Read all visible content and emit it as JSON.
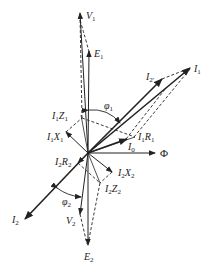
{
  "diagram": {
    "type": "transformer-phasor-diagram",
    "origin": [
      88,
      153
    ],
    "colors": {
      "line": "#222222",
      "background": "#ffffff"
    },
    "phasors": [
      {
        "id": "V1",
        "label": "V",
        "sub": "1",
        "to": [
          80,
          12
        ],
        "style": "solid-thin"
      },
      {
        "id": "E1",
        "label": "E",
        "sub": "1",
        "to": [
          89,
          52
        ],
        "style": "solid-thin"
      },
      {
        "id": "I1",
        "label": "I",
        "sub": "1",
        "to": [
          191,
          67
        ],
        "style": "solid-bold"
      },
      {
        "id": "I2p",
        "label": "I",
        "sub": "2'",
        "to": [
          162,
          78
        ],
        "style": "solid-bold"
      },
      {
        "id": "I0",
        "label": "I",
        "sub": "0",
        "to": [
          126,
          139
        ],
        "style": "solid-bold"
      },
      {
        "id": "Phi",
        "label": "Φ",
        "sub": "",
        "to": [
          155,
          153
        ],
        "style": "solid-thin"
      },
      {
        "id": "I2",
        "label": "I",
        "sub": "2",
        "to": [
          25,
          219
        ],
        "style": "solid-bold"
      },
      {
        "id": "V2",
        "label": "V",
        "sub": "2",
        "to": [
          80,
          214
        ],
        "style": "solid-thin"
      },
      {
        "id": "E2",
        "label": "E",
        "sub": "2",
        "to": [
          88,
          245
        ],
        "style": "solid-thin"
      },
      {
        "id": "I1X1",
        "label": "I",
        "sub": "1",
        "label2": "X",
        "sub2": "1",
        "to": [
          65,
          133
        ],
        "style": "solid-thin"
      },
      {
        "id": "I2X2",
        "label": "I",
        "sub": "2",
        "label2": "X",
        "sub2": "2",
        "to": [
          112,
          172
        ],
        "style": "solid-thin"
      }
    ],
    "labels": {
      "V1": {
        "main": "V",
        "sub": "1",
        "pos": [
          86,
          18
        ]
      },
      "E1": {
        "main": "E",
        "sub": "1",
        "pos": [
          94,
          57
        ]
      },
      "I1": {
        "main": "I",
        "sub": "1",
        "pos": [
          194,
          70
        ]
      },
      "I2p": {
        "main": "I",
        "sub": "2'",
        "pos": [
          146,
          79
        ]
      },
      "phi1": {
        "main": "φ",
        "sub": "1",
        "pos": [
          104,
          108
        ]
      },
      "I1Z1": {
        "main": "I",
        "sub": "1",
        "main2": "Z",
        "sub2": "1",
        "pos": [
          52,
          118
        ]
      },
      "I1X1": {
        "main": "I",
        "sub": "1",
        "main2": "X",
        "sub2": "1",
        "pos": [
          47,
          139
        ]
      },
      "I1R1": {
        "main": "I",
        "sub": "1",
        "main2": "R",
        "sub2": "1",
        "pos": [
          137,
          139
        ]
      },
      "I0": {
        "main": "I",
        "sub": "0",
        "pos": [
          128,
          149
        ]
      },
      "Phi": {
        "main": "Φ",
        "sub": "",
        "pos": [
          160,
          157
        ]
      },
      "I2R2": {
        "main": "I",
        "sub": "2",
        "main2": "R",
        "sub2": "2",
        "pos": [
          55,
          164
        ]
      },
      "I2X2": {
        "main": "I",
        "sub": "2",
        "main2": "X",
        "sub2": "2",
        "pos": [
          118,
          176
        ]
      },
      "I2Z2": {
        "main": "I",
        "sub": "2",
        "main2": "Z",
        "sub2": "2",
        "pos": [
          105,
          192
        ]
      },
      "phi2": {
        "main": "φ",
        "sub": "2",
        "pos": [
          62,
          205
        ]
      },
      "I2": {
        "main": "I",
        "sub": "2",
        "pos": [
          12,
          222
        ]
      },
      "V2": {
        "main": "V",
        "sub": "2",
        "pos": [
          66,
          224
        ]
      },
      "E2": {
        "main": "E",
        "sub": "2",
        "pos": [
          84,
          260
        ]
      }
    }
  }
}
